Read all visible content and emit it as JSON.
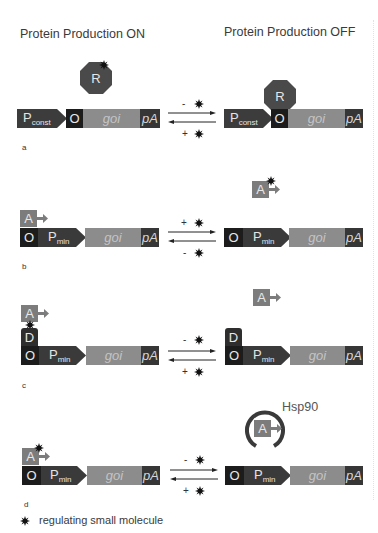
{
  "headings": {
    "left": "Protein Production ON",
    "right": "Protein Production OFF"
  },
  "elements": {
    "promoter_const": "P",
    "promoter_const_sub": "const",
    "promoter_min": "P",
    "promoter_min_sub": "min",
    "operator": "O",
    "gene": "goi",
    "polyA": "pA",
    "repressor": "R",
    "activator": "A",
    "dimerizer": "D",
    "chaperone": "Hsp90"
  },
  "panels": [
    {
      "label": "a",
      "forward_sign": "-",
      "reverse_sign": "+"
    },
    {
      "label": "b",
      "forward_sign": "+",
      "reverse_sign": "-"
    },
    {
      "label": "c",
      "forward_sign": "-",
      "reverse_sign": "+"
    },
    {
      "label": "d",
      "forward_sign": "-",
      "reverse_sign": "+"
    }
  ],
  "legend": {
    "icon": "star-burst-icon",
    "text": "regulating small molecule"
  },
  "colors": {
    "operator": "#1c1c1c",
    "promoter": "#3a3a3a",
    "gene": "#8c8c8c",
    "polyA": "#363636",
    "activator": "#7c7c7c",
    "repressor": "#4a4a4a",
    "dimerizer": "#2e2e2e",
    "chaperone_ring": "#3a3a3a"
  }
}
